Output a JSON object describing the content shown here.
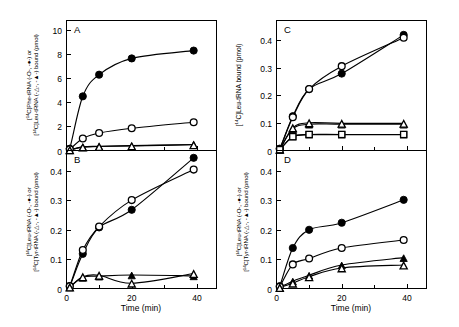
{
  "figure": {
    "title": "",
    "background_color": "#ffffff",
    "ink_color": "#000000",
    "panels": [
      "A",
      "B",
      "C",
      "D"
    ]
  },
  "panelA": {
    "letter": "A",
    "xlabel": "",
    "ylabel_line1_pre": "[",
    "ylabel_line1_sup": "14",
    "ylabel_line1_post": "C]Phe-tRNA (-O-, -●-) or",
    "ylabel_line2_pre": "[",
    "ylabel_line2_sup": "14",
    "ylabel_line2_post": "C]Leu-tRNA (-△-, -▲-) bound (pmol)",
    "yticks": [
      "0",
      "2",
      "4",
      "6",
      "8",
      "10"
    ],
    "xticks": [
      "0",
      "20",
      "40"
    ]
  },
  "panelB": {
    "letter": "B",
    "xlabel": "Time (min)",
    "ylabel_line1_pre": "[",
    "ylabel_line1_sup": "14",
    "ylabel_line1_post": "C]Leu-tRNA (-O-, -●-) or",
    "ylabel_line2_pre": "[",
    "ylabel_line2_sup": "14",
    "ylabel_line2_post": "C]Tyr-tRNA (-△-, -▲-) bound (pmol)",
    "yticks": [
      "0",
      "0.1",
      "0.2",
      "0.3",
      "0.4"
    ],
    "xticks": [
      "0",
      "20",
      "40"
    ]
  },
  "panelC": {
    "letter": "C",
    "xlabel": "",
    "ylabel_pre": "[",
    "ylabel_sup": "14",
    "ylabel_post": "C]Leu-tRNA bound (pmol)",
    "yticks": [
      "0",
      "0.1",
      "0.2",
      "0.3",
      "0.4"
    ],
    "xticks": [
      "0",
      "20",
      "40"
    ]
  },
  "panelD": {
    "letter": "D",
    "xlabel": "Time (min)",
    "ylabel_line1_pre": "[",
    "ylabel_line1_sup": "14",
    "ylabel_line1_post": "C]Leu-tRNA (-O-, -●-) or",
    "ylabel_line2_pre": "[",
    "ylabel_line2_sup": "14",
    "ylabel_line2_post": "C]Tyr-tRNA (-△-, -▲-) bound (pmol)",
    "yticks": [
      "0",
      "0.1",
      "0.2",
      "0.3",
      "0.4"
    ],
    "xticks": [
      "0",
      "20",
      "40"
    ]
  },
  "chart_data": [
    {
      "id": "A",
      "type": "scatter",
      "title": "A",
      "xlabel": "Time (min)",
      "ylabel": "[14C]Phe-tRNA (-O-, -●-) or [14C]Leu-tRNA (-△-, -▲-) bound (pmol)",
      "xlim": [
        0,
        46
      ],
      "ylim": [
        0,
        10.8
      ],
      "xticks": [
        0,
        20,
        40
      ],
      "xminorticks": [
        10,
        30
      ],
      "yticks": [
        0,
        2,
        4,
        6,
        8,
        10
      ],
      "grid": false,
      "legend": "none",
      "series": [
        {
          "name": "[14C]Phe-tRNA filled circle",
          "marker": "filled-circle",
          "x": [
            0,
            1,
            5,
            10,
            20,
            39
          ],
          "y": [
            0,
            0.15,
            4.5,
            6.3,
            7.65,
            8.3
          ]
        },
        {
          "name": "[14C]Phe-tRNA open circle",
          "marker": "open-circle",
          "x": [
            0,
            1,
            5,
            10,
            20,
            39
          ],
          "y": [
            0,
            0.1,
            1.0,
            1.45,
            1.85,
            2.35
          ]
        },
        {
          "name": "[14C]Leu-tRNA filled triangle",
          "marker": "filled-triangle",
          "x": [
            0,
            1,
            5,
            10,
            20,
            39
          ],
          "y": [
            0,
            0.05,
            0.3,
            0.35,
            0.4,
            0.5
          ]
        },
        {
          "name": "[14C]Leu-tRNA open triangle",
          "marker": "open-triangle",
          "x": [
            0,
            1,
            5,
            10,
            20,
            39
          ],
          "y": [
            0,
            0.05,
            0.28,
            0.33,
            0.38,
            0.48
          ]
        }
      ]
    },
    {
      "id": "B",
      "type": "scatter",
      "title": "B",
      "xlabel": "Time (min)",
      "ylabel": "[14C]Leu-tRNA (-O-, -●-) or [14C]Tyr-tRNA (-△-, -▲-) bound (pmol)",
      "xlim": [
        0,
        46
      ],
      "ylim": [
        0,
        0.47
      ],
      "xticks": [
        0,
        20,
        40
      ],
      "xminorticks": [
        10,
        30
      ],
      "yticks": [
        0,
        0.1,
        0.2,
        0.3,
        0.4
      ],
      "grid": false,
      "legend": "none",
      "series": [
        {
          "name": "[14C]Leu-tRNA filled circle",
          "marker": "filled-circle",
          "x": [
            0,
            1,
            5,
            10,
            20,
            39
          ],
          "y": [
            0,
            0.008,
            0.118,
            0.208,
            0.268,
            0.445
          ]
        },
        {
          "name": "[14C]Leu-tRNA open circle",
          "marker": "open-circle",
          "x": [
            0,
            1,
            5,
            10,
            20,
            39
          ],
          "y": [
            0,
            0.008,
            0.131,
            0.211,
            0.301,
            0.405
          ]
        },
        {
          "name": "[14C]Tyr-tRNA filled triangle",
          "marker": "filled-triangle",
          "x": [
            0,
            1,
            5,
            10,
            20,
            39
          ],
          "y": [
            0,
            0.005,
            0.038,
            0.042,
            0.046,
            0.043
          ]
        },
        {
          "name": "[14C]Tyr-tRNA open triangle",
          "marker": "open-triangle",
          "x": [
            0,
            1,
            5,
            10,
            20,
            39
          ],
          "y": [
            0,
            0.005,
            0.04,
            0.045,
            0.018,
            0.051
          ]
        }
      ]
    },
    {
      "id": "C",
      "type": "scatter",
      "title": "C",
      "xlabel": "Time (min)",
      "ylabel": "[14C]Leu-tRNA bound (pmol)",
      "xlim": [
        0,
        46
      ],
      "ylim": [
        0,
        0.47
      ],
      "xticks": [
        0,
        20,
        40
      ],
      "xminorticks": [
        10,
        30
      ],
      "yticks": [
        0,
        0.1,
        0.2,
        0.3,
        0.4
      ],
      "grid": false,
      "legend": "none",
      "series": [
        {
          "name": "filled circle",
          "marker": "filled-circle",
          "x": [
            0,
            1,
            5,
            10,
            20,
            39
          ],
          "y": [
            0,
            0.006,
            0.124,
            0.222,
            0.278,
            0.418
          ]
        },
        {
          "name": "open circle",
          "marker": "open-circle",
          "x": [
            0,
            1,
            5,
            10,
            20,
            39
          ],
          "y": [
            0,
            0.006,
            0.12,
            0.222,
            0.305,
            0.408
          ]
        },
        {
          "name": "filled triangle",
          "marker": "filled-triangle",
          "x": [
            0,
            1,
            5,
            10,
            20,
            39
          ],
          "y": [
            0,
            0.004,
            0.078,
            0.095,
            0.095,
            0.095
          ]
        },
        {
          "name": "open triangle",
          "marker": "open-triangle",
          "x": [
            0,
            1,
            5,
            10,
            20,
            39
          ],
          "y": [
            0,
            0.004,
            0.082,
            0.1,
            0.098,
            0.098
          ]
        },
        {
          "name": "filled square",
          "marker": "filled-square",
          "x": [
            0,
            1,
            5,
            10,
            20,
            39
          ],
          "y": [
            0,
            0.003,
            0.05,
            0.057,
            0.057,
            0.057
          ]
        },
        {
          "name": "open square",
          "marker": "open-square",
          "x": [
            0,
            1,
            5,
            10,
            20,
            39
          ],
          "y": [
            0,
            0.003,
            0.05,
            0.058,
            0.058,
            0.058
          ]
        }
      ]
    },
    {
      "id": "D",
      "type": "scatter",
      "title": "D",
      "xlabel": "Time (min)",
      "ylabel": "[14C]Leu-tRNA (-O-, -●-) or [14C]Tyr-tRNA (-△-, -▲-) bound (pmol)",
      "xlim": [
        0,
        46
      ],
      "ylim": [
        0,
        0.47
      ],
      "xticks": [
        0,
        20,
        40
      ],
      "xminorticks": [
        10,
        30
      ],
      "yticks": [
        0,
        0.1,
        0.2,
        0.3,
        0.4
      ],
      "grid": false,
      "legend": "none",
      "series": [
        {
          "name": "[14C]Leu-tRNA filled circle",
          "marker": "filled-circle",
          "x": [
            0,
            1,
            5,
            10,
            20,
            39
          ],
          "y": [
            0,
            0.008,
            0.138,
            0.2,
            0.224,
            0.302
          ]
        },
        {
          "name": "[14C]Leu-tRNA open circle",
          "marker": "open-circle",
          "x": [
            0,
            1,
            5,
            10,
            20,
            39
          ],
          "y": [
            0,
            0.006,
            0.082,
            0.102,
            0.138,
            0.165
          ]
        },
        {
          "name": "[14C]Tyr-tRNA filled triangle",
          "marker": "filled-triangle",
          "x": [
            0,
            1,
            5,
            10,
            20,
            39
          ],
          "y": [
            0,
            0.004,
            0.025,
            0.045,
            0.08,
            0.105
          ]
        },
        {
          "name": "[14C]Tyr-tRNA open triangle",
          "marker": "open-triangle",
          "x": [
            0,
            1,
            5,
            10,
            20,
            39
          ],
          "y": [
            0,
            0.003,
            0.018,
            0.04,
            0.07,
            0.08
          ]
        }
      ]
    }
  ]
}
